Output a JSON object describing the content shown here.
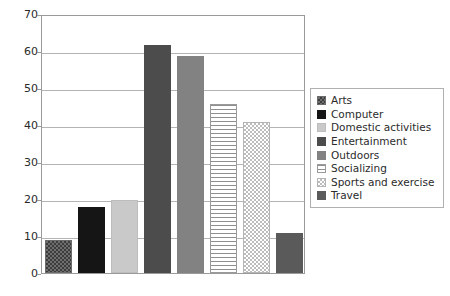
{
  "chart_data": {
    "type": "bar",
    "title": "",
    "xlabel": "",
    "ylabel": "",
    "ylim": [
      0,
      70
    ],
    "ytick_step": 10,
    "yticks": [
      "0",
      "10",
      "20",
      "30",
      "40",
      "50",
      "60",
      "70"
    ],
    "grid": true,
    "legend_position": "right",
    "categories": [
      "Arts",
      "Computer",
      "Domestic activities",
      "Entertainment",
      "Outdoors",
      "Socializing",
      "Sports and exercise",
      "Travel"
    ],
    "values": [
      9,
      17.8,
      19.7,
      61.6,
      58.7,
      45.6,
      40.7,
      10.7
    ],
    "series": [
      {
        "name": "Minutes per day",
        "values": [
          9,
          17.8,
          19.7,
          61.6,
          58.7,
          45.6,
          40.7,
          10.7
        ]
      }
    ],
    "bar_styles": [
      "fill-arts",
      "fill-computer",
      "fill-domestic",
      "fill-entertainment",
      "fill-outdoors",
      "fill-socializing",
      "fill-sports",
      "fill-travel"
    ],
    "colors": {
      "arts": "#6e6e6e",
      "computer": "#151515",
      "domestic_activities": "#c9c9c9",
      "entertainment": "#4c4c4c",
      "outdoors": "#828282",
      "socializing": "#ffffff",
      "sports_and_exercise": "#ffffff",
      "travel": "#5a5a5a",
      "gridline": "#b4b4b4",
      "axis": "#9a9a9a",
      "text": "#2b2b2b",
      "background": "#ffffff"
    }
  },
  "legend": {
    "items": [
      {
        "label": "Arts",
        "swatch": "fill-arts"
      },
      {
        "label": "Computer",
        "swatch": "fill-computer"
      },
      {
        "label": "Domestic activities",
        "swatch": "fill-domestic"
      },
      {
        "label": "Entertainment",
        "swatch": "fill-entertainment"
      },
      {
        "label": "Outdoors",
        "swatch": "fill-outdoors"
      },
      {
        "label": "Socializing",
        "swatch": "fill-socializing"
      },
      {
        "label": "Sports and exercise",
        "swatch": "fill-sports"
      },
      {
        "label": "Travel",
        "swatch": "fill-travel"
      }
    ]
  }
}
